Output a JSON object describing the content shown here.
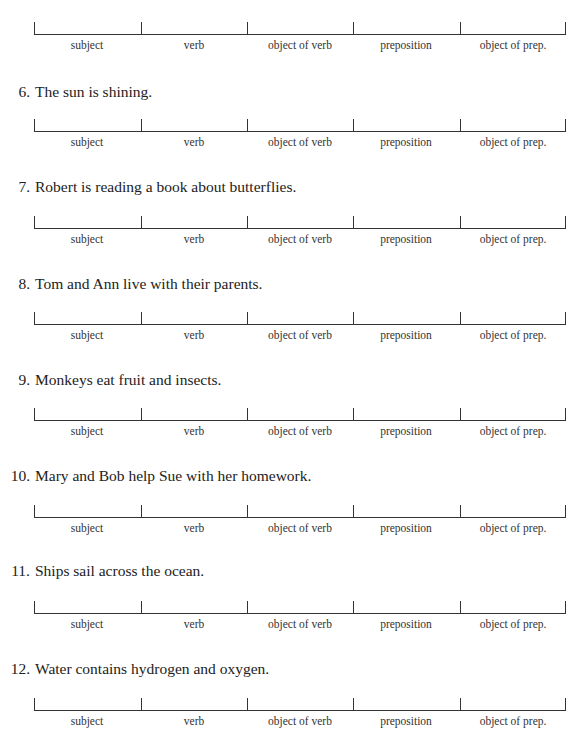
{
  "slot_labels": [
    "subject",
    "verb",
    "object of verb",
    "preposition",
    "object of prep."
  ],
  "exercises": [
    {
      "number": "",
      "sentence": ""
    },
    {
      "number": "6.",
      "sentence": "The sun is shining."
    },
    {
      "number": "7.",
      "sentence": "Robert is reading a book about butterflies."
    },
    {
      "number": "8.",
      "sentence": "Tom and Ann live with their parents."
    },
    {
      "number": "9.",
      "sentence": "Monkeys eat fruit and insects."
    },
    {
      "number": "10.",
      "sentence": "Mary and Bob help Sue with her homework."
    },
    {
      "number": "11.",
      "sentence": "Ships sail across the ocean."
    },
    {
      "number": "12.",
      "sentence": "Water contains hydrogen and oxygen."
    }
  ]
}
